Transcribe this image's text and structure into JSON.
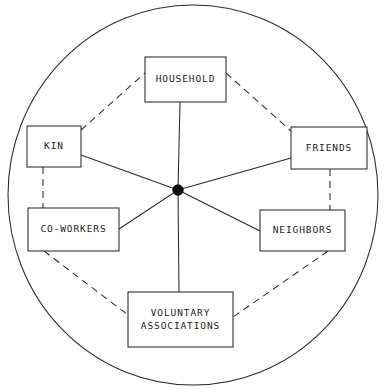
{
  "diagram": {
    "type": "radial-network-sociogram",
    "colors": {
      "stroke": "#2b2b2b",
      "hub_fill": "#0d0d0d",
      "box_fill": "#ffffff",
      "background": "#ffffff",
      "text": "#1a1a1a"
    },
    "boundary": {
      "shape": "ellipse",
      "cx": 193,
      "cy": 195,
      "rx": 185,
      "ry": 190,
      "style": "solid"
    },
    "hub": {
      "name": "ego",
      "cx": 178,
      "cy": 190,
      "r": 5.2,
      "style": "filled-dot"
    },
    "nodes": [
      {
        "id": "household",
        "label": "HOUSEHOLD",
        "lines": [
          "HOUSEHOLD"
        ],
        "x": 145,
        "y": 57,
        "w": 81,
        "h": 45
      },
      {
        "id": "kin",
        "label": "KIN",
        "lines": [
          "KIN"
        ],
        "x": 27,
        "y": 126,
        "w": 54,
        "h": 41
      },
      {
        "id": "friends",
        "label": "FRIENDS",
        "lines": [
          "FRIENDS"
        ],
        "x": 291,
        "y": 127,
        "w": 76,
        "h": 42
      },
      {
        "id": "co-workers",
        "label": "CO-WORKERS",
        "lines": [
          "CO-WORKERS"
        ],
        "x": 28,
        "y": 208,
        "w": 91,
        "h": 43
      },
      {
        "id": "neighbors",
        "label": "NEIGHBORS",
        "lines": [
          "NEIGHBORS"
        ],
        "x": 260,
        "y": 210,
        "w": 85,
        "h": 41
      },
      {
        "id": "voluntary-associations",
        "label": "VOLUNTARY ASSOCIATIONS",
        "lines": [
          "VOLUNTARY",
          "ASSOCIATIONS"
        ],
        "x": 128,
        "y": 292,
        "w": 105,
        "h": 55
      }
    ],
    "spokes": [
      {
        "from": "ego",
        "to": "household",
        "x1": 178,
        "y1": 190,
        "x2": 180,
        "y2": 102,
        "style": "solid"
      },
      {
        "from": "ego",
        "to": "kin",
        "x1": 178,
        "y1": 190,
        "x2": 81,
        "y2": 155,
        "style": "solid"
      },
      {
        "from": "ego",
        "to": "friends",
        "x1": 178,
        "y1": 190,
        "x2": 291,
        "y2": 158,
        "style": "solid"
      },
      {
        "from": "ego",
        "to": "co-workers",
        "x1": 178,
        "y1": 190,
        "x2": 119,
        "y2": 229,
        "style": "solid"
      },
      {
        "from": "ego",
        "to": "neighbors",
        "x1": 178,
        "y1": 190,
        "x2": 260,
        "y2": 231,
        "style": "solid"
      },
      {
        "from": "ego",
        "to": "voluntary-associations",
        "x1": 178,
        "y1": 190,
        "x2": 179,
        "y2": 292,
        "style": "solid"
      }
    ],
    "rim_links": [
      {
        "from": "kin",
        "to": "household",
        "x1": 81,
        "y1": 130,
        "x2": 145,
        "y2": 73,
        "style": "dashed"
      },
      {
        "from": "household",
        "to": "friends",
        "x1": 226,
        "y1": 73,
        "x2": 291,
        "y2": 131,
        "style": "dashed"
      },
      {
        "from": "kin",
        "to": "co-workers",
        "x1": 43,
        "y1": 167,
        "x2": 43,
        "y2": 208,
        "style": "dashed"
      },
      {
        "from": "friends",
        "to": "neighbors",
        "x1": 330,
        "y1": 169,
        "x2": 330,
        "y2": 210,
        "style": "dashed"
      },
      {
        "from": "co-workers",
        "to": "voluntary-associations",
        "x1": 44,
        "y1": 251,
        "x2": 128,
        "y2": 315,
        "style": "dashed"
      },
      {
        "from": "neighbors",
        "to": "voluntary-associations",
        "x1": 328,
        "y1": 251,
        "x2": 233,
        "y2": 317,
        "style": "dashed"
      }
    ]
  }
}
